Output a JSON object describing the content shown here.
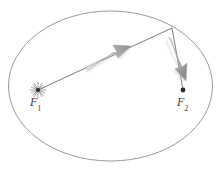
{
  "figure": {
    "background_color": "#ffffff",
    "width": 221,
    "height": 180,
    "ellipse": {
      "center_x": 110.5,
      "center_y": 86,
      "radius_x": 102,
      "radius_y": 75,
      "stroke_color": "#9a9a9a",
      "stroke_width": 1,
      "fill": "none"
    },
    "labels": {
      "focus1": {
        "symbol": "F",
        "subscript": "1",
        "text": "F1"
      },
      "focus2": {
        "symbol": "F",
        "subscript": "2",
        "text": "F2"
      }
    },
    "points": {
      "focus1": {
        "x": 38,
        "y": 90,
        "marker": "sun-starburst",
        "color": "#2b2b2b"
      },
      "focus2": {
        "x": 183,
        "y": 90,
        "marker": "filled-dot",
        "color": "#2b2b2b"
      },
      "orbit_point": {
        "x": 172,
        "y": 28,
        "marker": "vertex",
        "color": "#3a3a3a"
      }
    },
    "segments": [
      {
        "name": "focus1-to-orbit-point",
        "x1": 38,
        "y1": 90,
        "x2": 172,
        "y2": 28,
        "stroke_color": "#5a5a5a",
        "stroke_width": 0.8
      },
      {
        "name": "orbit-point-to-focus2",
        "x1": 172,
        "y1": 28,
        "x2": 183,
        "y2": 90,
        "stroke_color": "#5a5a5a",
        "stroke_width": 0.8
      }
    ],
    "arrows": [
      {
        "name": "radius-vector-arrow",
        "direction": "up-right",
        "tail_x": 86,
        "tail_y": 65,
        "tip_x": 131,
        "tip_y": 44,
        "fill_color": "#a8a8a8"
      },
      {
        "name": "focal-vector-arrow",
        "direction": "down-right",
        "tail_x": 168,
        "tail_y": 38,
        "tip_x": 186,
        "tip_y": 82,
        "fill_color": "#a8a8a8"
      }
    ]
  }
}
